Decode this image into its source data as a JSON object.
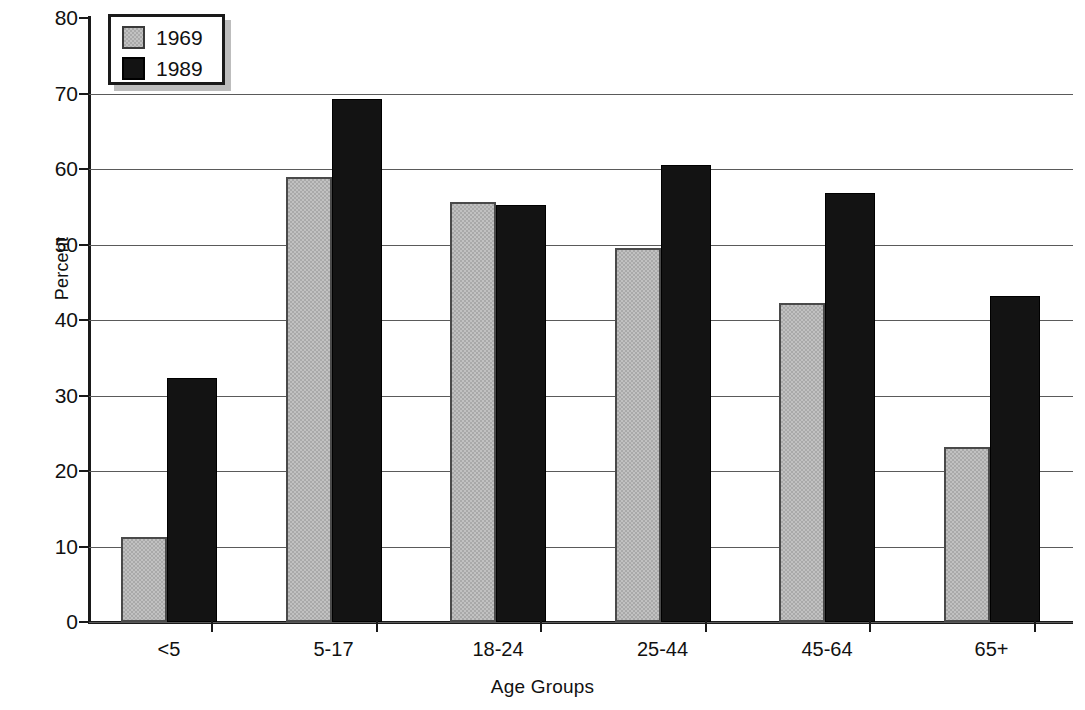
{
  "chart_data": {
    "type": "bar",
    "title": "",
    "xlabel": "Age Groups",
    "ylabel": "Percent",
    "categories": [
      "<5",
      "5-17",
      "18-24",
      "25-44",
      "45-64",
      "65+"
    ],
    "series": [
      {
        "name": "1969",
        "color": "#a9a9a9",
        "values": [
          11.3,
          58.9,
          55.6,
          49.5,
          42.2,
          23.2
        ]
      },
      {
        "name": "1989",
        "color": "#131313",
        "values": [
          32.3,
          69.3,
          55.2,
          60.5,
          56.8,
          43.2
        ]
      }
    ],
    "ylim": [
      0,
      80
    ],
    "ytick_values": [
      0,
      10,
      20,
      30,
      40,
      50,
      60,
      70,
      80
    ],
    "ytick_labels": [
      "0",
      "10",
      "20",
      "30",
      "40",
      "50",
      "60",
      "70",
      "80"
    ],
    "grid": true,
    "grid_axis": "y",
    "legend_position": "top-left",
    "legend_entries": [
      "1969",
      "1989"
    ]
  }
}
